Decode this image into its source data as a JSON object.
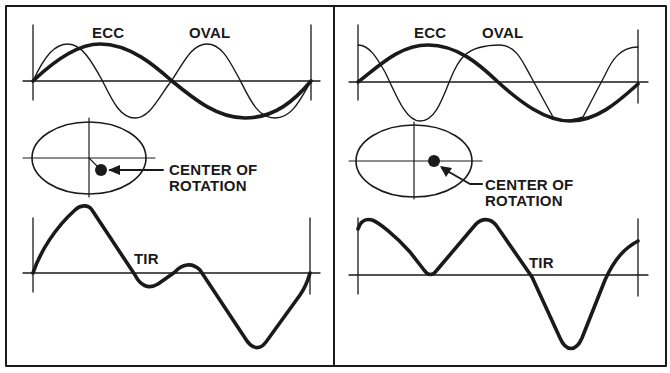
{
  "figure": {
    "background": "#ffffff",
    "ink_color": "#1a1a1a",
    "panels": [
      {
        "id": "left",
        "waveform_labels": {
          "ecc": "ECC",
          "oval": "OVAL"
        },
        "center_label_line1": "CENTER OF",
        "center_label_line2": "ROTATION",
        "tir_label": "TIR"
      },
      {
        "id": "right",
        "waveform_labels": {
          "ecc": "ECC",
          "oval": "OVAL"
        },
        "center_label_line1": "CENTER OF",
        "center_label_line2": "ROTATION",
        "tir_label": "TIR"
      }
    ]
  }
}
